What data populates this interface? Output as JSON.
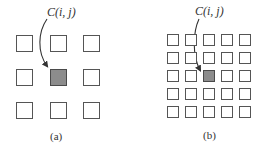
{
  "figure": {
    "panels": [
      {
        "id": "a",
        "caption": "(a)",
        "pointer_label": "C(i, j)",
        "grid": {
          "rows": 3,
          "cols": 3,
          "highlight": {
            "row": 1,
            "col": 1
          }
        }
      },
      {
        "id": "b",
        "caption": "(b)",
        "pointer_label": "C(i, j)",
        "grid": {
          "rows": 5,
          "cols": 5,
          "highlight": {
            "row": 2,
            "col": 2
          }
        }
      }
    ],
    "colors": {
      "cell_border": "#555555",
      "cell_fill": "#ffffff",
      "highlight_fill": "#8c8c8c",
      "arrow": "#333333"
    }
  }
}
